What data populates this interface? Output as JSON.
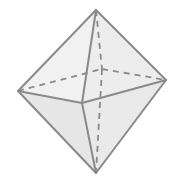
{
  "diagram": {
    "type": "octahedron",
    "width": 175,
    "height": 180,
    "vertices": {
      "top": [
        96,
        10
      ],
      "bottom": [
        96,
        173
      ],
      "left": [
        18,
        91
      ],
      "right": [
        166,
        80
      ],
      "front": [
        82,
        103
      ],
      "back": [
        102,
        69
      ]
    },
    "colors": {
      "background": "#ffffff",
      "edge": "#8a8a8a",
      "hidden_edge": "#8a8a8a",
      "face_upper_left": "#f1f1f1",
      "face_upper_right": "#ededed",
      "face_lower_left": "#e6e6e6",
      "face_lower_right": "#e9e9e9"
    }
  }
}
